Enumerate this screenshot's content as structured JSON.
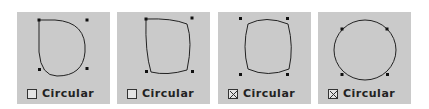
{
  "panels": [
    {
      "label": "Circular",
      "checked": false
    },
    {
      "label": "Circular",
      "checked": false
    },
    {
      "label": "Circular",
      "checked": true
    },
    {
      "label": "Circular",
      "checked": true
    }
  ]
}
